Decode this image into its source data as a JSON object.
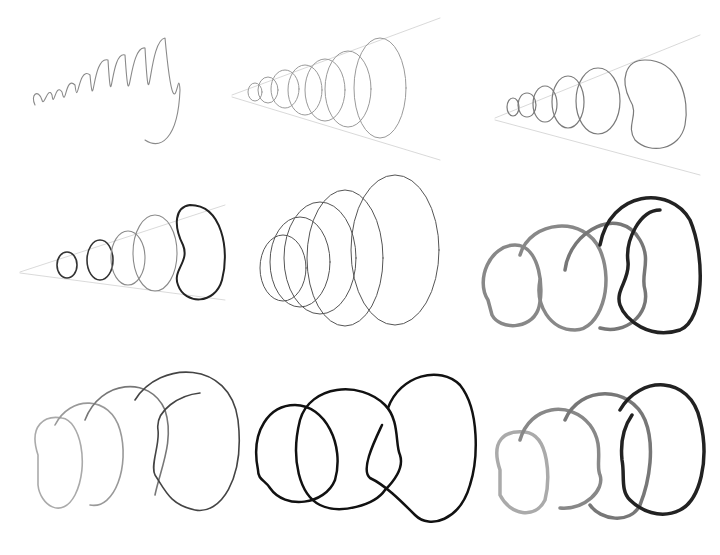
{
  "figure": {
    "panels": [
      {
        "row": 1,
        "col": 1,
        "style": "loose pencil spiral"
      },
      {
        "row": 1,
        "col": 2,
        "style": "pencil ellipses with perspective guide lines"
      },
      {
        "row": 1,
        "col": 3,
        "style": "pencil ellipses with facial profile notches and guides"
      },
      {
        "row": 2,
        "col": 1,
        "style": "pencil ellipses with darkened profile outline"
      },
      {
        "row": 2,
        "col": 2,
        "style": "clean thin concentric ellipses"
      },
      {
        "row": 2,
        "col": 3,
        "style": "gray-to-black gradient thick profile stroke"
      },
      {
        "row": 3,
        "col": 1,
        "style": "thin gray-to-black profile stroke"
      },
      {
        "row": 3,
        "col": 2,
        "style": "uniform black profile stroke"
      },
      {
        "row": 3,
        "col": 3,
        "style": "gray-to-black thick profile stroke, fewer loops"
      }
    ],
    "colors": {
      "pencil": "#8a8a8a",
      "light": "#b5b5b5",
      "mid": "#7a7a7a",
      "dark": "#1a1a1a"
    }
  }
}
